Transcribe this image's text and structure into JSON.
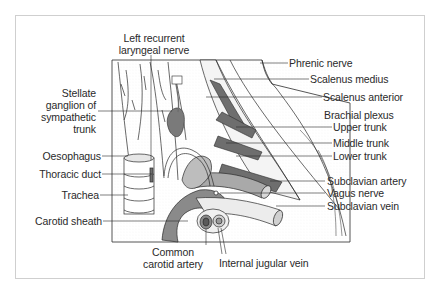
{
  "figure": {
    "labels_left": [
      {
        "id": "stellate",
        "lines": [
          "Stellate",
          "ganglion of",
          "sympathetic",
          "trunk"
        ]
      },
      {
        "id": "oesophagus",
        "text": "Oesophagus"
      },
      {
        "id": "thoracic-duct",
        "text": "Thoracic duct"
      },
      {
        "id": "trachea",
        "text": "Trachea"
      },
      {
        "id": "carotid-sheath",
        "text": "Carotid sheath"
      }
    ],
    "labels_top": [
      {
        "id": "left-recurrent",
        "lines": [
          "Left recurrent",
          "laryngeal nerve"
        ]
      }
    ],
    "labels_right": [
      {
        "id": "phrenic",
        "text": "Phrenic nerve"
      },
      {
        "id": "scalenus-medius",
        "text": "Scalenus medius"
      },
      {
        "id": "scalenus-anterior",
        "text": "Scalenus anterior"
      },
      {
        "id": "brachial-plexus",
        "text": "Brachial plexus"
      },
      {
        "id": "upper-trunk",
        "text": "Upper trunk"
      },
      {
        "id": "middle-trunk",
        "text": "Middle trunk"
      },
      {
        "id": "lower-trunk",
        "text": "Lower trunk"
      },
      {
        "id": "subclavian-artery",
        "text": "Subclavian artery"
      },
      {
        "id": "vagus",
        "text": "Vagus nerve"
      },
      {
        "id": "subclavian-vein",
        "text": "Subclavian vein"
      }
    ],
    "labels_bottom": [
      {
        "id": "common-carotid",
        "lines": [
          "Common",
          "carotid artery"
        ]
      },
      {
        "id": "internal-jugular",
        "text": "Internal jugular vein"
      }
    ],
    "colors": {
      "dark_structure": "#6e6e6e",
      "mid_structure": "#a9a9a9",
      "light_structure": "#e8e8e8",
      "line": "#2a2a2a",
      "frame": "#cfcfcf"
    }
  }
}
